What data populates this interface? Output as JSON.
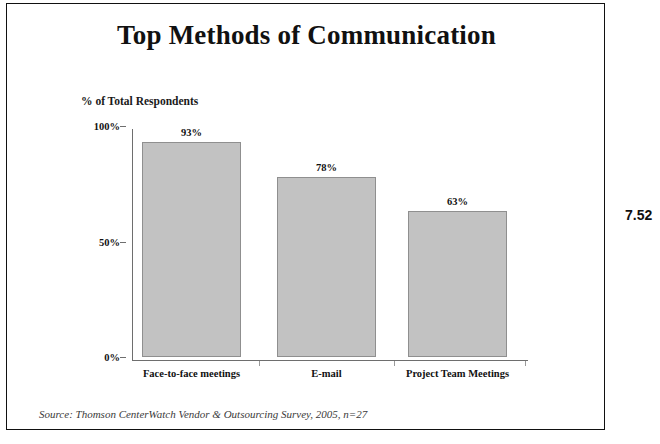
{
  "slide": {
    "title": "Top Methods of Communication",
    "page_number": "7.52",
    "source_note": "Source: Thomson CenterWatch Vendor & Outsourcing Survey, 2005, n=27",
    "frame_color": "#111111"
  },
  "chart_data": {
    "type": "bar",
    "title": "Top Methods of Communication",
    "subtitle": "",
    "xlabel": "",
    "ylabel": "% of Total Respondents",
    "categories": [
      "Face-to-face meetings",
      "E-mail",
      "Project Team Meetings"
    ],
    "values": [
      93,
      78,
      63
    ],
    "value_labels": [
      "93%",
      "78%",
      "63%"
    ],
    "ylim": [
      0,
      100
    ],
    "yticks": [
      0,
      50,
      100
    ],
    "ytick_labels": [
      "0%",
      "50%",
      "100%"
    ],
    "grid": false,
    "legend": false,
    "bar_fill_color": "#c2c2c2",
    "bar_border_color": "#8f8f8f",
    "axis_color": "#6e6e6e"
  }
}
